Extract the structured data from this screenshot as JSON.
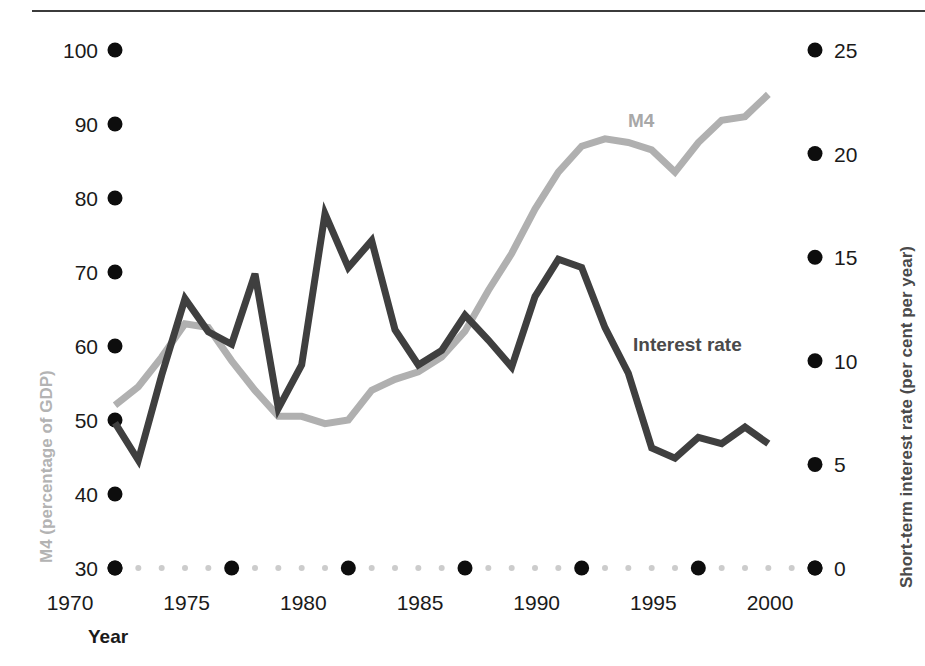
{
  "figure": {
    "background": "#ffffff",
    "rule_color": "#3b3b3b"
  },
  "axes": {
    "left": {
      "title": "M4 (percentage of GDP)",
      "title_color": "#b3b3b3",
      "ticks": [
        "100",
        "90",
        "80",
        "70",
        "60",
        "50",
        "40",
        "30"
      ],
      "tick_values": [
        100,
        90,
        80,
        70,
        60,
        50,
        40,
        30
      ],
      "min": 30,
      "max": 100,
      "marker": "dot-marker"
    },
    "right": {
      "title": "Short-term interest rate (per cent per year)",
      "title_color": "#4a4a4a",
      "ticks": [
        "25",
        "20",
        "15",
        "10",
        "5",
        "0"
      ],
      "tick_values": [
        25,
        20,
        15,
        10,
        5,
        0
      ],
      "min": 0,
      "max": 25,
      "marker": "dot-marker"
    },
    "bottom": {
      "title": "Year",
      "ticks": [
        "1970",
        "1975",
        "1980",
        "1985",
        "1990",
        "1995",
        "2000"
      ],
      "tick_values": [
        1970,
        1975,
        1980,
        1985,
        1990,
        1995,
        2000
      ],
      "min": 1970,
      "max": 2000,
      "minor_tick_color": "#cccccc",
      "major_tick_color": "#0d0d0d"
    }
  },
  "annotations": [
    {
      "text": "M4",
      "color": "#a8a8a8",
      "x": 628,
      "y": 111
    },
    {
      "text": "Interest rate",
      "color": "#4a4a4a",
      "x": 633,
      "y": 335
    }
  ],
  "chart_data": {
    "type": "line",
    "title": "",
    "subtitle": "",
    "xlabel": "Year",
    "ylabel": "M4 (percentage of GDP)",
    "y2label": "Short-term interest rate (per cent per year)",
    "xlim": [
      1970,
      2000
    ],
    "ylim": [
      30,
      100
    ],
    "y2lim": [
      0,
      25
    ],
    "grid": false,
    "legend": "inline-annotations",
    "x": [
      1970,
      1971,
      1972,
      1973,
      1974,
      1975,
      1976,
      1977,
      1978,
      1979,
      1980,
      1981,
      1982,
      1983,
      1984,
      1985,
      1986,
      1987,
      1988,
      1989,
      1990,
      1991,
      1992,
      1993,
      1994,
      1995,
      1996,
      1997,
      1998
    ],
    "series": [
      {
        "name": "M4",
        "axis": "left",
        "color": "#b0b0b0",
        "units": "percentage of GDP",
        "values": [
          52.0,
          54.5,
          58.5,
          63.0,
          62.5,
          58.0,
          54.0,
          50.5,
          50.5,
          49.5,
          50.0,
          54.0,
          55.5,
          56.5,
          58.5,
          62.0,
          67.5,
          72.5,
          78.5,
          83.5,
          87.0,
          88.0,
          87.5,
          86.5,
          83.5,
          87.5,
          90.5,
          91.0,
          94.0
        ]
      },
      {
        "name": "Interest rate",
        "axis": "right",
        "color": "#3f3f3f",
        "units": "per cent per year",
        "values": [
          7.0,
          5.2,
          9.3,
          13.0,
          11.4,
          10.8,
          14.2,
          7.7,
          9.8,
          17.1,
          14.5,
          15.8,
          11.5,
          9.8,
          10.5,
          12.2,
          11.0,
          9.7,
          13.1,
          14.9,
          14.5,
          11.6,
          9.4,
          5.8,
          5.3,
          6.3,
          6.0,
          6.8,
          6.0
        ]
      }
    ]
  }
}
